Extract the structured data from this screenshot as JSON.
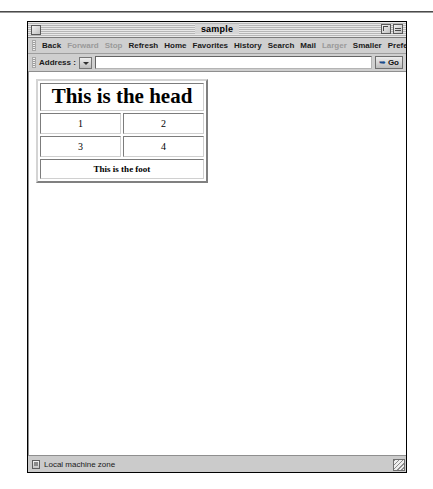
{
  "window": {
    "title": "sample",
    "close_label": "",
    "zoom_label": "",
    "collapse_label": ""
  },
  "toolbar": {
    "items": [
      {
        "label": "Back",
        "disabled": false
      },
      {
        "label": "Forward",
        "disabled": true
      },
      {
        "label": "Stop",
        "disabled": true
      },
      {
        "label": "Refresh",
        "disabled": false
      },
      {
        "label": "Home",
        "disabled": false
      },
      {
        "label": "Favorites",
        "disabled": false
      },
      {
        "label": "History",
        "disabled": false
      },
      {
        "label": "Search",
        "disabled": false
      },
      {
        "label": "Mail",
        "disabled": false
      },
      {
        "label": "Larger",
        "disabled": true
      },
      {
        "label": "Smaller",
        "disabled": false
      },
      {
        "label": "Preferences",
        "disabled": false
      },
      {
        "label": "AutoFill",
        "disabled": true
      }
    ]
  },
  "address_bar": {
    "label": "Address :",
    "value": "",
    "placeholder": "",
    "go_label": "Go",
    "go_icon": "go-arrow-icon",
    "dropdown_icon": "chevron-down-icon"
  },
  "document": {
    "table": {
      "head": [
        "This is the head"
      ],
      "body": [
        [
          "1",
          "2"
        ],
        [
          "3",
          "4"
        ]
      ],
      "foot": [
        "This is the foot"
      ]
    }
  },
  "status_bar": {
    "zone_icon": "security-zone-icon",
    "zone_text": "Local machine zone"
  }
}
